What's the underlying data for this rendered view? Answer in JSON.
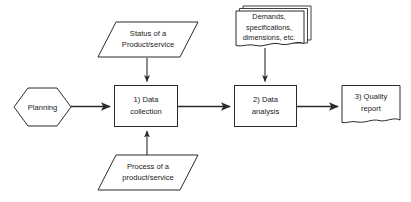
{
  "diagram": {
    "colors": {
      "stroke": "#2b2b2b",
      "fill": "#ffffff",
      "text": "#1a1a1a",
      "background": "#ffffff"
    },
    "nodes": [
      {
        "id": "planning",
        "shape": "hexagon",
        "lines": [
          "Planning"
        ]
      },
      {
        "id": "status-input",
        "shape": "parallelogram",
        "lines": [
          "Status of a",
          "Product/service"
        ]
      },
      {
        "id": "process-input",
        "shape": "parallelogram",
        "lines": [
          "Process of a",
          "product/service"
        ]
      },
      {
        "id": "data-collection",
        "shape": "rectangle",
        "lines": [
          "1) Data",
          "collection"
        ]
      },
      {
        "id": "demands-documents",
        "shape": "multi-document",
        "lines": [
          "Demands,",
          "specifications,",
          "dimensions, etc."
        ]
      },
      {
        "id": "data-analysis",
        "shape": "rectangle",
        "lines": [
          "2) Data",
          "analysis"
        ]
      },
      {
        "id": "quality-report",
        "shape": "document",
        "lines": [
          "3) Quality",
          "report"
        ]
      }
    ],
    "edges": [
      {
        "id": "planning-to-collection",
        "from": "planning",
        "to": "data-collection",
        "direction": "right"
      },
      {
        "id": "status-to-collection",
        "from": "status-input",
        "to": "data-collection",
        "direction": "down"
      },
      {
        "id": "process-to-collection",
        "from": "process-input",
        "to": "data-collection",
        "direction": "up"
      },
      {
        "id": "collection-to-analysis",
        "from": "data-collection",
        "to": "data-analysis",
        "direction": "right"
      },
      {
        "id": "demands-to-analysis",
        "from": "demands-documents",
        "to": "data-analysis",
        "direction": "down"
      },
      {
        "id": "analysis-to-report",
        "from": "data-analysis",
        "to": "quality-report",
        "direction": "right"
      }
    ]
  }
}
